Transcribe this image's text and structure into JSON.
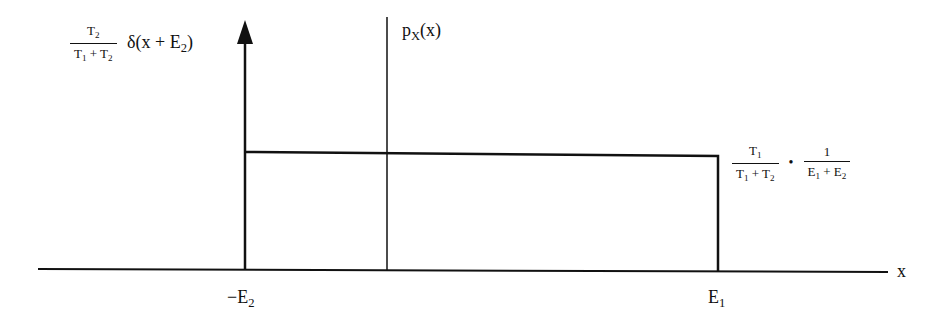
{
  "diagram": {
    "x_axis_label": "x",
    "ticks": [
      {
        "label_main": "−E",
        "label_sub": "2",
        "x": 245
      },
      {
        "label_main": "E",
        "label_sub": "1",
        "x": 718
      }
    ],
    "delta_label": {
      "frac_num_main": "T",
      "frac_num_sub": "2",
      "frac_den_a": "T",
      "frac_den_a_sub": "1",
      "frac_den_op": " + ",
      "frac_den_b": "T",
      "frac_den_b_sub": "2",
      "expr_pre": "δ(x + E",
      "expr_sub": "2",
      "expr_post": ")"
    },
    "pdf_label": {
      "main": "p",
      "sub": "X",
      "post": "(x)"
    },
    "level_label": {
      "f1_num": "T",
      "f1_num_sub": "1",
      "f1_den_a": "T",
      "f1_den_a_sub": "1",
      "f1_den_op": " + ",
      "f1_den_b": "T",
      "f1_den_b_sub": "2",
      "dot": "•",
      "f2_num": "1",
      "f2_den_a": "E",
      "f2_den_a_sub": "1",
      "f2_den_op": " + ",
      "f2_den_b": "E",
      "f2_den_b_sub": "2"
    },
    "stroke_color": "#111111"
  }
}
